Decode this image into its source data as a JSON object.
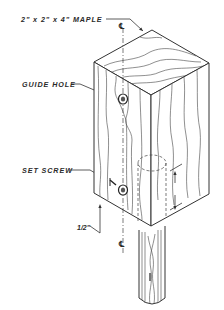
{
  "diagram": {
    "type": "isometric technical drawing",
    "labels": {
      "material": "2\" x 2\" x 4\" MAPLE",
      "guide_hole": "GUIDE HOLE",
      "set_screw": "SET SCREW",
      "dim_half_inch": "1/2\"",
      "dim_one_inch": "1\"",
      "centerline_top": "℄",
      "centerline_bottom": "℄"
    },
    "colors": {
      "ink": "#333333",
      "background": "#ffffff"
    }
  }
}
